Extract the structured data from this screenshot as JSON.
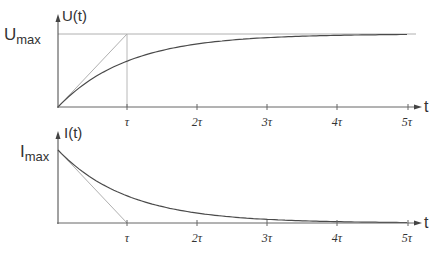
{
  "chart_data": [
    {
      "type": "line",
      "title": "Capacitor charging voltage",
      "ylabel": "U(t)",
      "ylabel_max": {
        "main": "U",
        "sub": "max"
      },
      "xlabel": "t",
      "x_ticks": [
        "τ",
        "2τ",
        "3τ",
        "4τ",
        "5τ"
      ],
      "x_tick_values": [
        1,
        2,
        3,
        4,
        5
      ],
      "xlim": [
        0,
        5.2
      ],
      "ylim": [
        0,
        1
      ],
      "series": [
        {
          "name": "U(t) = Umax(1 - e^(-t/τ))",
          "x": [
            0,
            0.5,
            1,
            1.5,
            2,
            2.5,
            3,
            3.5,
            4,
            4.5,
            5
          ],
          "values": [
            0,
            0.393,
            0.632,
            0.777,
            0.865,
            0.918,
            0.95,
            0.97,
            0.982,
            0.989,
            0.993
          ],
          "color": "#444444"
        },
        {
          "name": "initial tangent",
          "x": [
            0,
            1
          ],
          "values": [
            0,
            1
          ],
          "color": "#aaaaaa"
        },
        {
          "name": "Umax asymptote",
          "x": [
            0,
            5
          ],
          "values": [
            1,
            1
          ],
          "color": "#aaaaaa"
        }
      ],
      "grid": false
    },
    {
      "type": "line",
      "title": "Capacitor charging current",
      "ylabel": "I(t)",
      "ylabel_max": {
        "main": "I",
        "sub": "max"
      },
      "xlabel": "t",
      "x_ticks": [
        "τ",
        "2τ",
        "3τ",
        "4τ",
        "5τ"
      ],
      "x_tick_values": [
        1,
        2,
        3,
        4,
        5
      ],
      "xlim": [
        0,
        5.2
      ],
      "ylim": [
        0,
        1
      ],
      "series": [
        {
          "name": "I(t) = Imax e^(-t/τ)",
          "x": [
            0,
            0.5,
            1,
            1.5,
            2,
            2.5,
            3,
            3.5,
            4,
            4.5,
            5
          ],
          "values": [
            1,
            0.607,
            0.368,
            0.223,
            0.135,
            0.082,
            0.05,
            0.03,
            0.018,
            0.011,
            0.007
          ],
          "color": "#444444"
        },
        {
          "name": "initial tangent",
          "x": [
            0,
            1
          ],
          "values": [
            1,
            0
          ],
          "color": "#aaaaaa"
        }
      ],
      "grid": false
    }
  ],
  "labels": {
    "u_axis": "U(t)",
    "u_max_main": "U",
    "u_max_sub": "max",
    "i_axis": "I(t)",
    "i_max_main": "I",
    "i_max_sub": "max",
    "t_axis": "t",
    "ticks": [
      "τ",
      "2τ",
      "3τ",
      "4τ",
      "5τ"
    ]
  }
}
